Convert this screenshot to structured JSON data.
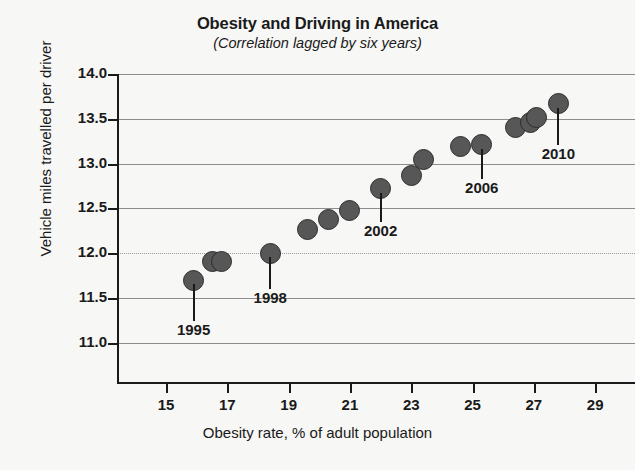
{
  "chart_data": {
    "type": "scatter",
    "title": "Obesity and Driving in America",
    "subtitle": "(Correlation lagged by six years)",
    "xlabel": "Obesity rate, % of adult population",
    "ylabel": "Vehicle miles travelled per driver",
    "xlim": [
      13.4,
      30.3
    ],
    "ylim": [
      10.55,
      14.0
    ],
    "xticks": [
      15,
      17,
      19,
      21,
      23,
      25,
      27,
      29
    ],
    "yticks": [
      11.0,
      11.5,
      12.0,
      12.5,
      13.0,
      13.5,
      14.0
    ],
    "xtick_labels": [
      "15",
      "17",
      "19",
      "21",
      "23",
      "25",
      "27",
      "29"
    ],
    "ytick_labels": [
      "11.0",
      "11.5",
      "12.0",
      "12.5",
      "13.0",
      "13.5",
      "14.0"
    ],
    "grid": "horizontal",
    "legend": "none",
    "marker_color": "#575757",
    "marker_edge_color": "#2b2b2b",
    "points": [
      {
        "x": 15.9,
        "y": 11.7,
        "label": "1995"
      },
      {
        "x": 16.5,
        "y": 11.91,
        "label": ""
      },
      {
        "x": 16.8,
        "y": 11.91,
        "label": ""
      },
      {
        "x": 18.4,
        "y": 12.0,
        "label": "1998"
      },
      {
        "x": 19.6,
        "y": 12.26,
        "label": ""
      },
      {
        "x": 20.3,
        "y": 12.38,
        "label": ""
      },
      {
        "x": 21.0,
        "y": 12.48,
        "label": ""
      },
      {
        "x": 22.0,
        "y": 12.72,
        "label": "2002"
      },
      {
        "x": 23.0,
        "y": 12.87,
        "label": ""
      },
      {
        "x": 23.4,
        "y": 13.05,
        "label": ""
      },
      {
        "x": 24.6,
        "y": 13.19,
        "label": ""
      },
      {
        "x": 25.3,
        "y": 13.21,
        "label": "2006"
      },
      {
        "x": 26.4,
        "y": 13.4,
        "label": ""
      },
      {
        "x": 26.9,
        "y": 13.46,
        "label": ""
      },
      {
        "x": 27.1,
        "y": 13.51,
        "label": ""
      },
      {
        "x": 27.8,
        "y": 13.67,
        "label": "2010"
      }
    ],
    "annotations": [
      {
        "label": "1995",
        "x": 15.9,
        "y": 11.7,
        "text_y": 11.22
      },
      {
        "label": "1998",
        "x": 18.4,
        "y": 12.0,
        "text_y": 11.58
      },
      {
        "label": "2002",
        "x": 22.0,
        "y": 12.72,
        "text_y": 12.32
      },
      {
        "label": "2006",
        "x": 25.3,
        "y": 13.21,
        "text_y": 12.8
      },
      {
        "label": "2010",
        "x": 27.8,
        "y": 13.67,
        "text_y": 13.18
      }
    ]
  }
}
